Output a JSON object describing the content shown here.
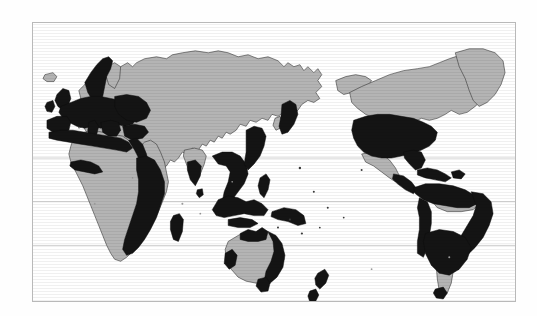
{
  "figure": {
    "type": "world-map",
    "title": "",
    "caption": "",
    "projection": "equirectangular, Pacific-centered",
    "background_color": "#ffffff",
    "frame": {
      "visible": true,
      "color": "#b9b9b9",
      "x": 32,
      "y": 22,
      "width": 484,
      "height": 280
    }
  },
  "legend": {
    "visible": false,
    "entries": [
      {
        "key": "highlighted",
        "label": "",
        "color": "#141414",
        "description": "countries shaded solid black"
      },
      {
        "key": "other_land",
        "label": "",
        "color": "#b4b4b4",
        "description": "remaining land shaded light gray"
      },
      {
        "key": "ocean",
        "label": "",
        "color": "#ffffff",
        "description": "ocean / water left white"
      }
    ]
  },
  "graticule": {
    "stroke_color": "#c9c9c9",
    "lines": [
      {
        "name": "tropic-of-cancer",
        "label": "",
        "y_px": 136
      },
      {
        "name": "equator",
        "label": "",
        "y_px": 180
      },
      {
        "name": "tropic-of-capricorn",
        "label": "",
        "y_px": 224
      }
    ]
  },
  "regions": {
    "highlighted": [
      "Norway",
      "Sweden",
      "United Kingdom",
      "Ireland",
      "Denmark",
      "Germany",
      "Netherlands",
      "Belgium",
      "France",
      "Spain",
      "Portugal",
      "Italy",
      "Switzerland",
      "Austria",
      "Poland",
      "Czechia",
      "Hungary",
      "Romania",
      "Bulgaria",
      "Greece",
      "Turkey",
      "Ukraine",
      "Belarus",
      "Baltic states",
      "Morocco",
      "Algeria",
      "Tunisia",
      "Libya",
      "Egypt",
      "Ghana",
      "Togo",
      "Benin",
      "Nigeria coast",
      "Angola",
      "Zambia",
      "Zimbabwe",
      "Mozambique",
      "Tanzania",
      "Kenya",
      "Madagascar",
      "South Africa east coast",
      "India south",
      "Sri Lanka",
      "Myanmar coast",
      "Thailand",
      "Vietnam",
      "Malaysia",
      "Indonesia",
      "Philippines",
      "Japan",
      "Papua New Guinea",
      "Australia east",
      "Australia north",
      "Australia southwest",
      "New Zealand",
      "United States",
      "Mexico coast",
      "Cuba",
      "Caribbean islands",
      "Colombia",
      "Venezuela",
      "Guyana",
      "Peru",
      "Brazil coast",
      "Bolivia",
      "Paraguay",
      "Uruguay",
      "Argentina north",
      "Chile north"
    ],
    "other_land": [
      "Canada",
      "Greenland",
      "Alaska",
      "Iceland",
      "Finland",
      "Russia",
      "Kazakhstan",
      "Mongolia",
      "China",
      "Korea",
      "Iran",
      "Iraq",
      "Saudi Arabia",
      "Afghanistan",
      "Pakistan",
      "India interior",
      "Sudan",
      "Chad",
      "Niger",
      "Mali",
      "Mauritania",
      "Ethiopia",
      "Congo",
      "Namibia",
      "Botswana",
      "Australia interior",
      "Brazil interior",
      "Argentina south",
      "Antarctica"
    ]
  }
}
